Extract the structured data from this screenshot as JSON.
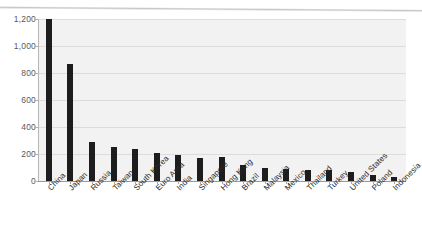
{
  "artifacts": {
    "bleed_through_text": "COMPOSITION OF RESERVES"
  },
  "chart_data": {
    "type": "bar",
    "title": "",
    "subtitle": "",
    "xlabel": "",
    "ylabel": "",
    "ylim": [
      0,
      1200
    ],
    "ytick_step": 200,
    "ytick_labels": [
      "1,200",
      "1,000",
      "800",
      "600",
      "400",
      "200",
      "0"
    ],
    "ytick_values": [
      1200,
      1000,
      800,
      600,
      400,
      200,
      0
    ],
    "grid": true,
    "grid_axis": "y",
    "legend": false,
    "legend_position": "none",
    "bar_color": "#1d1d1d",
    "plot_background": "#f2f2f2",
    "categories": [
      "China",
      "Japan",
      "Russia",
      "Taiwan",
      "South Korea",
      "Euro Area",
      "India",
      "Singapore",
      "Hong Kong",
      "Brazil",
      "Malaysia",
      "Mexico",
      "Thailand",
      "Turkey",
      "United States",
      "Poland",
      "Indonesia"
    ],
    "values": [
      1200,
      870,
      290,
      255,
      235,
      205,
      190,
      170,
      180,
      115,
      95,
      90,
      85,
      80,
      65,
      45,
      30
    ]
  }
}
